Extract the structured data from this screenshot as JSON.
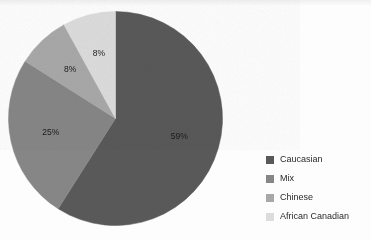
{
  "background_color": "#fdfdfd",
  "chart_data": {
    "type": "pie",
    "title": "",
    "subtitle": "",
    "xlabel": "",
    "ylabel": "",
    "grid": false,
    "legend_position": "right",
    "start_angle_deg": 0,
    "direction": "clockwise",
    "categories": [
      "Caucasian",
      "Mix",
      "Chinese",
      "African Canadian"
    ],
    "values": [
      59,
      25,
      8,
      8
    ],
    "value_unit": "%",
    "data_labels": [
      "59%",
      "25%",
      "8%",
      "8%"
    ],
    "colors": [
      "#595959",
      "#868686",
      "#a8a8a8",
      "#dcdcdc"
    ],
    "slices": [
      {
        "label": "Caucasian",
        "value": 59,
        "data_label": "59%",
        "color": "#595959"
      },
      {
        "label": "Mix",
        "value": 25,
        "data_label": "25%",
        "color": "#868686"
      },
      {
        "label": "Chinese",
        "value": 8,
        "data_label": "8%",
        "color": "#a8a8a8"
      },
      {
        "label": "African Canadian",
        "value": 8,
        "data_label": "8%",
        "color": "#dcdcdc"
      }
    ]
  },
  "legend": {
    "items": [
      {
        "label": "Caucasian",
        "color": "#595959"
      },
      {
        "label": "Mix",
        "color": "#868686"
      },
      {
        "label": "Chinese",
        "color": "#a8a8a8"
      },
      {
        "label": "African Canadian",
        "color": "#dcdcdc"
      }
    ]
  }
}
